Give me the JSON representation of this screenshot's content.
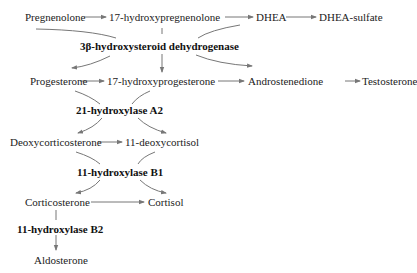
{
  "diagram": {
    "type": "steroidogenesis-pathway",
    "colors": {
      "text": "#222222",
      "arrow": "#777777",
      "background": "#ffffff"
    },
    "nodes": {
      "pregnenolone": "Pregnenolone",
      "hydroxypregnenolone": "17-hydroxypregnenolone",
      "dhea": "DHEA",
      "dhea_sulfate": "DHEA-sulfate",
      "progesterone": "Progesterone",
      "hydroxyprogesterone": "17-hydroxyprogesterone",
      "androstenedione": "Androstenedione",
      "testosterone": "Testosterone",
      "deoxycorticosterone": "Deoxycorticosterone",
      "deoxycortisol": "11-deoxycortisol",
      "corticosterone": "Corticosterone",
      "cortisol": "Cortisol",
      "aldosterone": "Aldosterone"
    },
    "enzymes": {
      "hsd3b": "3β-hydroxysteroid dehydrogenase",
      "cyp21a2": "21-hydroxylase A2",
      "cyp11b1": "11-hydroxylase B1",
      "cyp11b2": "11-hydroxylase B2"
    },
    "edges": [
      [
        "Pregnenolone",
        "17-hydroxypregnenolone"
      ],
      [
        "17-hydroxypregnenolone",
        "DHEA"
      ],
      [
        "DHEA",
        "DHEA-sulfate"
      ],
      [
        "Pregnenolone",
        "Progesterone",
        "3β-hydroxysteroid dehydrogenase"
      ],
      [
        "17-hydroxypregnenolone",
        "17-hydroxyprogesterone",
        "3β-hydroxysteroid dehydrogenase"
      ],
      [
        "DHEA",
        "Androstenedione",
        "3β-hydroxysteroid dehydrogenase"
      ],
      [
        "Progesterone",
        "17-hydroxyprogesterone"
      ],
      [
        "17-hydroxyprogesterone",
        "Androstenedione"
      ],
      [
        "Androstenedione",
        "Testosterone"
      ],
      [
        "Progesterone",
        "Deoxycorticosterone",
        "21-hydroxylase A2"
      ],
      [
        "17-hydroxyprogesterone",
        "11-deoxycortisol",
        "21-hydroxylase A2"
      ],
      [
        "Deoxycorticosterone",
        "11-deoxycortisol"
      ],
      [
        "Deoxycorticosterone",
        "Corticosterone",
        "11-hydroxylase B1"
      ],
      [
        "11-deoxycortisol",
        "Cortisol",
        "11-hydroxylase B1"
      ],
      [
        "Corticosterone",
        "Cortisol"
      ],
      [
        "Corticosterone",
        "Aldosterone",
        "11-hydroxylase B2"
      ]
    ]
  }
}
